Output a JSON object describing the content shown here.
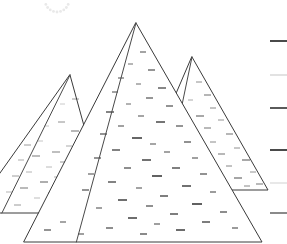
{
  "scene": {
    "title": "Three Pyramids Line Drawing",
    "width": 287,
    "height": 244,
    "background_color": "#ffffff",
    "outline_color": "#3a3a3a",
    "description": "Black-and-white line drawing of three overlapping pyramids with stippled block texture on their faces"
  },
  "pyramids": [
    {
      "name": "left-pyramid",
      "label": "Left Pyramid",
      "apex": {
        "x": 70,
        "y": 75
      },
      "base_left": {
        "x": -28,
        "y": 213
      },
      "base_right": {
        "x": 108,
        "y": 213
      },
      "texture_tone": "#9a9a9a",
      "outline_color": "#4a4a4a"
    },
    {
      "name": "right-pyramid",
      "label": "Right Pyramid",
      "apex": {
        "x": 192,
        "y": 57
      },
      "base_left": {
        "x": 135,
        "y": 190
      },
      "base_right": {
        "x": 268,
        "y": 190
      },
      "texture_tone": "#6a6a6a",
      "outline_color": "#4a4a4a"
    },
    {
      "name": "center-pyramid",
      "label": "Center Pyramid",
      "apex": {
        "x": 136,
        "y": 23
      },
      "base_left": {
        "x": 24,
        "y": 242
      },
      "base_right": {
        "x": 262,
        "y": 242
      },
      "texture_tone": "#2e2e2e",
      "outline_color": "#333333"
    }
  ],
  "scale_marks": {
    "name": "right-edge-scale",
    "label": "Right Edge Tick Marks",
    "x_start": 270,
    "x_end": 287,
    "ticks": [
      {
        "y": 41,
        "color": "#4a4a4a",
        "width": 2
      },
      {
        "y": 75,
        "color": "#d8d8d8",
        "width": 1.5
      },
      {
        "y": 108,
        "color": "#5a5a5a",
        "width": 2
      },
      {
        "y": 150,
        "color": "#4a4a4a",
        "width": 2
      },
      {
        "y": 183,
        "color": "#e0e0e0",
        "width": 1.5
      },
      {
        "y": 213,
        "color": "#8a8a8a",
        "width": 2
      }
    ]
  },
  "sun_arc": {
    "name": "faint-dotted-arc",
    "label": "Faint Dotted Arc",
    "center_x": 57,
    "center_y": 0,
    "radius": 12,
    "dot_count": 9,
    "color": "#ececec"
  },
  "block_texture": {
    "name": "stone-block-dashes",
    "label": "Stone Block Dash Texture",
    "left": [
      [
        34,
        118,
        5,
        0.8,
        "#b4b4b4"
      ],
      [
        47,
        110,
        6,
        0.9,
        "#a8a8a8"
      ],
      [
        60,
        104,
        5,
        0.8,
        "#bcbcbc"
      ],
      [
        72,
        99,
        7,
        1.0,
        "#9a9a9a"
      ],
      [
        84,
        112,
        6,
        0.9,
        "#a0a0a0"
      ],
      [
        30,
        131,
        6,
        0.9,
        "#b0b0b0"
      ],
      [
        44,
        126,
        5,
        0.8,
        "#bababa"
      ],
      [
        58,
        122,
        7,
        1.0,
        "#909090"
      ],
      [
        71,
        131,
        8,
        1.1,
        "#7e7e7e"
      ],
      [
        86,
        127,
        6,
        0.9,
        "#a6a6a6"
      ],
      [
        24,
        145,
        7,
        1.0,
        "#9c9c9c"
      ],
      [
        38,
        141,
        5,
        0.8,
        "#b8b8b8"
      ],
      [
        52,
        152,
        8,
        1.1,
        "#8a8a8a"
      ],
      [
        66,
        146,
        6,
        0.9,
        "#a2a2a2"
      ],
      [
        80,
        143,
        7,
        1.0,
        "#949494"
      ],
      [
        94,
        150,
        6,
        0.9,
        "#aeaeae"
      ],
      [
        18,
        160,
        6,
        0.9,
        "#a4a4a4"
      ],
      [
        32,
        156,
        8,
        1.1,
        "#868686"
      ],
      [
        46,
        167,
        6,
        0.9,
        "#b2b2b2"
      ],
      [
        60,
        162,
        7,
        1.0,
        "#989898"
      ],
      [
        74,
        159,
        5,
        0.8,
        "#bebebe"
      ],
      [
        88,
        168,
        8,
        1.1,
        "#808080"
      ],
      [
        12,
        176,
        7,
        1.0,
        "#9e9e9e"
      ],
      [
        26,
        172,
        6,
        0.9,
        "#acacac"
      ],
      [
        40,
        182,
        8,
        1.2,
        "#787878"
      ],
      [
        54,
        177,
        6,
        0.9,
        "#a6a6a6"
      ],
      [
        68,
        174,
        7,
        1.0,
        "#929292"
      ],
      [
        82,
        184,
        6,
        0.9,
        "#b0b0b0"
      ],
      [
        96,
        180,
        7,
        1.0,
        "#8e8e8e"
      ],
      [
        6,
        192,
        6,
        0.9,
        "#aaaaaa"
      ],
      [
        20,
        188,
        8,
        1.1,
        "#828282"
      ],
      [
        34,
        198,
        6,
        0.9,
        "#b6b6b6"
      ],
      [
        48,
        193,
        7,
        1.0,
        "#969696"
      ],
      [
        62,
        190,
        6,
        0.9,
        "#a8a8a8"
      ],
      [
        76,
        200,
        8,
        1.2,
        "#747474"
      ],
      [
        90,
        196,
        6,
        0.9,
        "#b4b4b4"
      ],
      [
        14,
        205,
        7,
        1.0,
        "#9a9a9a"
      ],
      [
        42,
        207,
        6,
        0.9,
        "#a2a2a2"
      ],
      [
        70,
        205,
        7,
        1.0,
        "#8c8c8c"
      ],
      [
        98,
        203,
        5,
        0.8,
        "#bcbcbc"
      ]
    ],
    "right": [
      [
        196,
        82,
        6,
        1.0,
        "#8e8e8e"
      ],
      [
        204,
        95,
        7,
        1.1,
        "#7a7a7a"
      ],
      [
        188,
        100,
        5,
        0.9,
        "#a0a0a0"
      ],
      [
        210,
        108,
        6,
        1.0,
        "#888888"
      ],
      [
        196,
        116,
        8,
        1.2,
        "#6e6e6e"
      ],
      [
        218,
        120,
        6,
        1.0,
        "#949494"
      ],
      [
        204,
        128,
        7,
        1.1,
        "#808080"
      ],
      [
        188,
        132,
        5,
        0.9,
        "#a4a4a4"
      ],
      [
        226,
        134,
        7,
        1.1,
        "#7c7c7c"
      ],
      [
        210,
        142,
        6,
        1.0,
        "#8a8a8a"
      ],
      [
        196,
        146,
        8,
        1.2,
        "#6a6a6a"
      ],
      [
        234,
        148,
        6,
        1.0,
        "#909090"
      ],
      [
        218,
        154,
        7,
        1.1,
        "#7e7e7e"
      ],
      [
        202,
        158,
        5,
        0.9,
        "#9c9c9c"
      ],
      [
        242,
        160,
        8,
        1.2,
        "#707070"
      ],
      [
        226,
        166,
        6,
        1.0,
        "#868686"
      ],
      [
        208,
        170,
        7,
        1.1,
        "#787878"
      ],
      [
        250,
        172,
        6,
        1.0,
        "#929292"
      ],
      [
        234,
        178,
        8,
        1.2,
        "#6c6c6c"
      ],
      [
        216,
        182,
        6,
        1.0,
        "#8c8c8c"
      ],
      [
        256,
        184,
        7,
        1.1,
        "#828282"
      ],
      [
        244,
        186,
        6,
        1.0,
        "#888888"
      ],
      [
        200,
        186,
        5,
        0.9,
        "#989898"
      ]
    ],
    "center": [
      [
        140,
        52,
        6,
        1.1,
        "#5a5a5a"
      ],
      [
        128,
        64,
        5,
        1.0,
        "#6e6e6e"
      ],
      [
        148,
        70,
        7,
        1.2,
        "#4e4e4e"
      ],
      [
        118,
        78,
        6,
        1.1,
        "#606060"
      ],
      [
        136,
        84,
        5,
        1.0,
        "#6a6a6a"
      ],
      [
        158,
        88,
        8,
        1.3,
        "#464646"
      ],
      [
        112,
        92,
        6,
        1.1,
        "#585858"
      ],
      [
        146,
        98,
        7,
        1.2,
        "#505050"
      ],
      [
        126,
        104,
        5,
        1.0,
        "#666666"
      ],
      [
        166,
        106,
        7,
        1.2,
        "#4a4a4a"
      ],
      [
        106,
        112,
        8,
        1.3,
        "#424242"
      ],
      [
        138,
        116,
        6,
        1.1,
        "#5c5c5c"
      ],
      [
        156,
        122,
        9,
        1.4,
        "#3a3a3a"
      ],
      [
        118,
        126,
        6,
        1.1,
        "#545454"
      ],
      [
        176,
        126,
        7,
        1.2,
        "#4e4e4e"
      ],
      [
        100,
        134,
        7,
        1.2,
        "#4c4c4c"
      ],
      [
        132,
        138,
        10,
        1.5,
        "#343434"
      ],
      [
        150,
        144,
        6,
        1.1,
        "#5e5e5e"
      ],
      [
        184,
        142,
        7,
        1.2,
        "#484848"
      ],
      [
        112,
        150,
        8,
        1.3,
        "#3e3e3e"
      ],
      [
        164,
        152,
        6,
        1.1,
        "#585858"
      ],
      [
        94,
        158,
        7,
        1.2,
        "#505050"
      ],
      [
        142,
        160,
        9,
        1.4,
        "#363636"
      ],
      [
        192,
        158,
        6,
        1.1,
        "#525252"
      ],
      [
        124,
        168,
        7,
        1.2,
        "#444444"
      ],
      [
        172,
        168,
        8,
        1.3,
        "#3c3c3c"
      ],
      [
        88,
        174,
        6,
        1.1,
        "#565656"
      ],
      [
        152,
        176,
        10,
        1.5,
        "#2e2e2e"
      ],
      [
        200,
        174,
        7,
        1.2,
        "#4a4a4a"
      ],
      [
        108,
        182,
        8,
        1.3,
        "#404040"
      ],
      [
        136,
        188,
        6,
        1.1,
        "#585858"
      ],
      [
        182,
        186,
        9,
        1.4,
        "#343434"
      ],
      [
        82,
        190,
        7,
        1.2,
        "#4e4e4e"
      ],
      [
        160,
        196,
        8,
        1.3,
        "#3a3a3a"
      ],
      [
        210,
        192,
        6,
        1.1,
        "#4c4c4c"
      ],
      [
        118,
        200,
        9,
        1.4,
        "#323232"
      ],
      [
        146,
        206,
        7,
        1.2,
        "#464646"
      ],
      [
        192,
        204,
        10,
        1.5,
        "#2c2c2c"
      ],
      [
        96,
        208,
        6,
        1.1,
        "#545454"
      ],
      [
        170,
        214,
        8,
        1.3,
        "#383838"
      ],
      [
        220,
        212,
        7,
        1.2,
        "#424242"
      ],
      [
        128,
        218,
        9,
        1.4,
        "#303030"
      ],
      [
        154,
        224,
        6,
        1.1,
        "#505050"
      ],
      [
        202,
        222,
        8,
        1.3,
        "#363636"
      ],
      [
        106,
        228,
        7,
        1.2,
        "#444444"
      ],
      [
        176,
        230,
        9,
        1.4,
        "#2e2e2e"
      ],
      [
        232,
        228,
        6,
        1.1,
        "#4a4a4a"
      ],
      [
        140,
        234,
        7,
        1.2,
        "#3c3c3c"
      ],
      [
        60,
        222,
        6,
        1.1,
        "#5c5c5c"
      ],
      [
        44,
        230,
        7,
        1.2,
        "#4e4e4e"
      ],
      [
        78,
        234,
        6,
        1.1,
        "#525252"
      ],
      [
        36,
        220,
        5,
        1.0,
        "#666666"
      ]
    ]
  }
}
